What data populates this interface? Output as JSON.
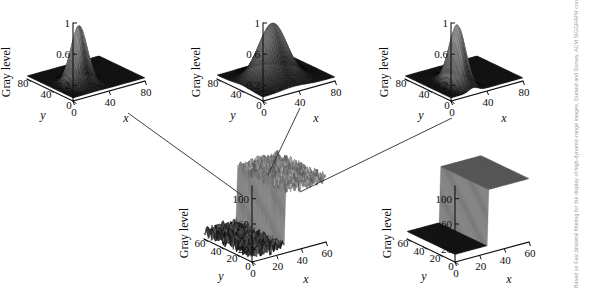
{
  "figure": {
    "background_color": "#ffffff",
    "ink_color": "#0d0d0d",
    "surface_color": "#2b2b2b",
    "connector_color": "#2a2a2a"
  },
  "watermark": {
    "text": "Based on Fast bilateral filtering for the display of high-dynamic-range images, Durand and Dorsey, ACM SIGGRAPH conference (c) 2002, Association for Computing Machinery, Inc. http://doi.acm.org/10.1145/566570.566574",
    "color": "#9a9a9a"
  },
  "chart_data": [
    {
      "id": "plot-top-left",
      "type": "surface",
      "title": "",
      "zlabel": "Gray level",
      "xlabel": "x",
      "ylabel": "y",
      "xticks": [
        0,
        40,
        80
      ],
      "yticks": [
        0,
        40,
        80
      ],
      "zticks": [
        0.2,
        0.6,
        1
      ],
      "xlim": [
        0,
        80
      ],
      "ylim": [
        0,
        80
      ],
      "zlim": [
        0,
        1
      ],
      "grid": false,
      "legend": "none",
      "surface_kind": "gaussian",
      "peak_value": 0.78,
      "peak_x": 26,
      "peak_y": 30,
      "sigma_x": 7,
      "sigma_y": 9,
      "base_value": 0.04,
      "noise": 0.0
    },
    {
      "id": "plot-top-middle",
      "type": "surface",
      "title": "",
      "zlabel": "Gray level",
      "xlabel": "x",
      "ylabel": "y",
      "xticks": [
        0,
        40,
        80
      ],
      "yticks": [
        0,
        40,
        80
      ],
      "zticks": [
        0.2,
        0.6,
        1
      ],
      "xlim": [
        0,
        80
      ],
      "ylim": [
        0,
        80
      ],
      "zlim": [
        0,
        1
      ],
      "grid": false,
      "legend": "none",
      "surface_kind": "gaussian",
      "peak_value": 0.76,
      "peak_x": 34,
      "peak_y": 36,
      "sigma_x": 13,
      "sigma_y": 14,
      "base_value": 0.05,
      "noise": 0.0
    },
    {
      "id": "plot-top-right",
      "type": "surface",
      "title": "",
      "zlabel": "Gray level",
      "xlabel": "x",
      "ylabel": "y",
      "xticks": [
        0,
        40,
        80
      ],
      "yticks": [
        0,
        40,
        80
      ],
      "zticks": [
        0.2,
        0.6,
        1
      ],
      "xlim": [
        0,
        80
      ],
      "ylim": [
        0,
        80
      ],
      "zlim": [
        0,
        1
      ],
      "grid": false,
      "legend": "none",
      "surface_kind": "gaussian",
      "peak_value": 0.8,
      "peak_x": 25,
      "peak_y": 28,
      "sigma_x": 5,
      "sigma_y": 12,
      "base_value": 0.04,
      "noise": 0.0
    },
    {
      "id": "plot-bottom-left",
      "type": "surface",
      "title": "",
      "zlabel": "Gray level",
      "xlabel": "x",
      "ylabel": "y",
      "xticks": [
        0,
        20,
        40,
        60
      ],
      "yticks": [
        0,
        20,
        40,
        60
      ],
      "zticks": [
        20,
        60,
        100
      ],
      "xlim": [
        0,
        60
      ],
      "ylim": [
        0,
        60
      ],
      "zlim": [
        0,
        120
      ],
      "grid": false,
      "legend": "none",
      "surface_kind": "noisy-step",
      "step_x": 27,
      "low_value": 12,
      "high_value": 100,
      "noise": 9
    },
    {
      "id": "plot-bottom-right",
      "type": "surface",
      "title": "",
      "zlabel": "Gray level",
      "xlabel": "x",
      "ylabel": "y",
      "xticks": [
        0,
        20,
        40,
        60
      ],
      "yticks": [
        0,
        20,
        40,
        60
      ],
      "zticks": [
        20,
        60,
        100
      ],
      "xlim": [
        0,
        60
      ],
      "ylim": [
        0,
        60
      ],
      "zlim": [
        0,
        120
      ],
      "grid": false,
      "legend": "none",
      "surface_kind": "clean-step",
      "step_x": 27,
      "low_value": 12,
      "high_value": 100,
      "noise": 0
    }
  ],
  "connectors": [
    {
      "name": "from-top-left",
      "from": [
        128,
        113
      ],
      "to": [
        243,
        196
      ]
    },
    {
      "name": "from-top-middle",
      "from": [
        300,
        108
      ],
      "to": [
        268,
        175
      ]
    },
    {
      "name": "from-top-right",
      "from": [
        452,
        118
      ],
      "to": [
        300,
        192
      ]
    }
  ]
}
